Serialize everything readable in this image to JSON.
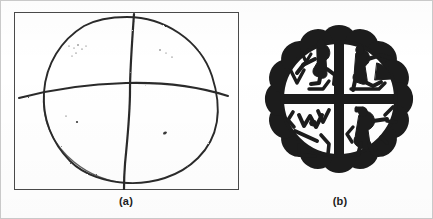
{
  "figure": {
    "background_color": "#ffffff",
    "ink_color": "#262626",
    "border_color": "#c9c9c9",
    "panels": [
      {
        "id": "a",
        "caption": "(a)",
        "type": "hand-drawn-sketch",
        "description": "Hand-drawn lopsided circle divided by one vertical and one horizontal line inside a thin rectangular frame",
        "frame": {
          "stroke_color": "#4a4a4a",
          "stroke_width": 1.4
        },
        "strokes": [
          {
            "name": "circle-outline",
            "kind": "closed-freehand-circle"
          },
          {
            "name": "vertical-divider",
            "kind": "freehand-line"
          },
          {
            "name": "horizontal-divider",
            "kind": "freehand-line"
          }
        ],
        "speck_count": 12
      },
      {
        "id": "b",
        "caption": "(b)",
        "type": "pottery-rosette-design",
        "description": "Black and white quartered rosette with scalloped petal border and abstract figural motifs in each quadrant",
        "petal_count": 16,
        "quadrant_count": 4,
        "ink_color": "#1a1a1a",
        "field_color": "#ffffff"
      }
    ]
  },
  "chart_data": {
    "type": "diagram",
    "title": "",
    "panels": [
      "(a)",
      "(b)"
    ]
  }
}
